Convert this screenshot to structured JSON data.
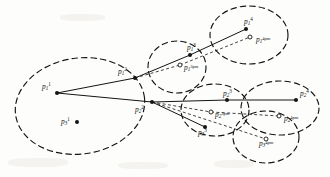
{
  "figure": {
    "kind": "trajectory-uncertainty-ellipse-diagram",
    "width": 330,
    "height": 177,
    "background_color": "#fdfdfc",
    "stroke_color": "#141414",
    "nodes": [
      {
        "id": "p1_1",
        "base": "p",
        "sub": "1",
        "sup": "1",
        "x": 57,
        "y": 93,
        "marker": "filled",
        "label_dx": -15,
        "label_dy": -11
      },
      {
        "id": "p3_1",
        "base": "p",
        "sub": "3",
        "sup": "1",
        "x": 77,
        "y": 122,
        "marker": "filled",
        "label_dx": -16,
        "label_dy": -5
      },
      {
        "id": "p1_2",
        "base": "p",
        "sub": "1",
        "sup": "2",
        "x": 135,
        "y": 78,
        "marker": "filled",
        "label_dx": -17,
        "label_dy": -11
      },
      {
        "id": "p2_2",
        "base": "p",
        "sub": "2",
        "sup": "2",
        "x": 152,
        "y": 102,
        "marker": "filled",
        "label_dx": -17,
        "label_dy": 3
      },
      {
        "id": "p1_3",
        "base": "p",
        "sub": "1",
        "sup": "3",
        "x": 190,
        "y": 55,
        "marker": "filled",
        "label_dx": -3,
        "label_dy": -12
      },
      {
        "id": "p1_3pm",
        "base": "p",
        "sub": "1",
        "sup": "3pm",
        "x": 180,
        "y": 65,
        "marker": "open",
        "label_dx": 4,
        "label_dy": -1
      },
      {
        "id": "p1_4",
        "base": "p",
        "sub": "1",
        "sup": "4",
        "x": 246,
        "y": 29,
        "marker": "filled",
        "label_dx": -2,
        "label_dy": -12
      },
      {
        "id": "p1_4pm",
        "base": "p",
        "sub": "1",
        "sup": "4pm",
        "x": 250,
        "y": 37,
        "marker": "open",
        "label_dx": 6,
        "label_dy": -1
      },
      {
        "id": "p2_3",
        "base": "p",
        "sub": "2",
        "sup": "3",
        "x": 227,
        "y": 100,
        "marker": "filled",
        "label_dx": -4,
        "label_dy": -11
      },
      {
        "id": "p2_3pm",
        "base": "p",
        "sub": "2",
        "sup": "3pm",
        "x": 211,
        "y": 112,
        "marker": "open",
        "label_dx": 4,
        "label_dy": -1
      },
      {
        "id": "p3_3",
        "base": "p",
        "sub": "3",
        "sup": "3",
        "x": 205,
        "y": 127,
        "marker": "filled",
        "label_dx": -7,
        "label_dy": 1
      },
      {
        "id": "p2_4",
        "base": "p",
        "sub": "2",
        "sup": "4",
        "x": 296,
        "y": 100,
        "marker": "filled",
        "label_dx": 4,
        "label_dy": -11
      },
      {
        "id": "p2_4pm",
        "base": "p",
        "sub": "2",
        "sup": "4pm",
        "x": 279,
        "y": 116,
        "marker": "open",
        "label_dx": 5,
        "label_dy": -1
      },
      {
        "id": "p3_4pm",
        "base": "p",
        "sub": "3",
        "sup": "4pm",
        "x": 266,
        "y": 139,
        "marker": "open",
        "label_dx": -7,
        "label_dy": 1
      }
    ],
    "ellipses": [
      {
        "id": "ellipse-p1-1",
        "cx": 80,
        "cy": 106,
        "rx": 65,
        "ry": 48,
        "rot": -8,
        "style": "dashed"
      },
      {
        "id": "ellipse-p1-3",
        "cx": 177,
        "cy": 67,
        "rx": 29,
        "ry": 26,
        "rot": 0,
        "style": "dashed"
      },
      {
        "id": "ellipse-p1-4",
        "cx": 249,
        "cy": 35,
        "rx": 39,
        "ry": 29,
        "rot": 0,
        "style": "dashed"
      },
      {
        "id": "ellipse-p2-3",
        "cx": 215,
        "cy": 110,
        "rx": 34,
        "ry": 26,
        "rot": 0,
        "style": "dashed"
      },
      {
        "id": "ellipse-p2-4",
        "cx": 280,
        "cy": 108,
        "rx": 39,
        "ry": 27,
        "rot": 0,
        "style": "dashed"
      },
      {
        "id": "ellipse-p3-4pm",
        "cx": 266,
        "cy": 137,
        "rx": 33,
        "ry": 26,
        "rot": 0,
        "style": "dashed"
      }
    ],
    "solid_edges": [
      {
        "id": "edge-p1_1-p1_2",
        "from": "p1_1",
        "to": "p1_2"
      },
      {
        "id": "edge-p1_2-p1_3",
        "from": "p1_2",
        "to": "p1_3"
      },
      {
        "id": "edge-p1_3-p1_4",
        "from": "p1_3",
        "to": "p1_4"
      },
      {
        "id": "edge-p1_1-p2_2",
        "from": "p1_1",
        "to": "p2_2"
      },
      {
        "id": "edge-p2_2-p2_3",
        "from": "p2_2",
        "to": "p2_3"
      },
      {
        "id": "edge-p2_3-p2_4",
        "from": "p2_3",
        "to": "p2_4"
      },
      {
        "id": "edge-p2_2-p3_3",
        "from": "p2_2",
        "to": "p3_3"
      }
    ],
    "dashed_edges": [
      {
        "id": "pred-p1_2-p1_3pm",
        "from": "p1_2",
        "to": "p1_3pm"
      },
      {
        "id": "pred-p1_3pm-p1_4pm",
        "from": "p1_3pm",
        "to": "p1_4pm"
      },
      {
        "id": "pred-p2_2-p2_3pm",
        "from": "p2_2",
        "to": "p2_3pm"
      },
      {
        "id": "pred-p2_3pm-p2_4pm",
        "from": "p2_3pm",
        "to": "p2_4pm"
      },
      {
        "id": "pred-p2_2-p3_4pm",
        "from": "p2_2",
        "to": "p3_4pm"
      }
    ],
    "caption": ""
  }
}
